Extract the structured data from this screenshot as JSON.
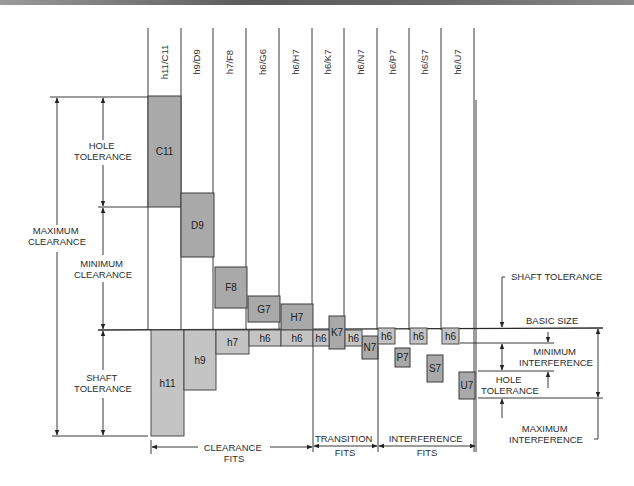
{
  "diagram": {
    "basic_size_y": 330,
    "column_lines_x": [
      148,
      181,
      213,
      246,
      279,
      312,
      344,
      377,
      409,
      441,
      474
    ],
    "columns": [
      {
        "header": "h11/C11"
      },
      {
        "header": "h9/D9"
      },
      {
        "header": "h7/F8"
      },
      {
        "header": "h6/G6"
      },
      {
        "header": "h6/H7"
      },
      {
        "header": "h6/K7"
      },
      {
        "header": "h6/N7"
      },
      {
        "header": "h6/P7"
      },
      {
        "header": "h6/S7"
      },
      {
        "header": "h6/U7"
      }
    ],
    "hole_boxes": [
      {
        "label": "C11",
        "x": 148,
        "y": 96,
        "w": 33,
        "h": 111
      },
      {
        "label": "D9",
        "x": 181,
        "y": 193,
        "w": 33,
        "h": 64
      },
      {
        "label": "F8",
        "x": 215,
        "y": 267,
        "w": 32,
        "h": 41
      },
      {
        "label": "G7",
        "x": 248,
        "y": 296,
        "w": 32,
        "h": 26
      },
      {
        "label": "H7",
        "x": 281,
        "y": 304,
        "w": 32,
        "h": 26
      },
      {
        "label": "K7",
        "x": 329,
        "y": 316,
        "w": 16,
        "h": 33
      },
      {
        "label": "N7",
        "x": 362,
        "y": 336,
        "w": 16,
        "h": 23
      },
      {
        "label": "P7",
        "x": 395,
        "y": 348,
        "w": 15,
        "h": 19
      },
      {
        "label": "S7",
        "x": 427,
        "y": 355,
        "w": 16,
        "h": 27
      },
      {
        "label": "U7",
        "x": 459,
        "y": 372,
        "w": 16,
        "h": 27
      }
    ],
    "shaft_boxes": [
      {
        "label": "h11",
        "x": 151,
        "y": 330,
        "w": 33,
        "h": 106
      },
      {
        "label": "h9",
        "x": 184,
        "y": 330,
        "w": 32,
        "h": 60
      },
      {
        "label": "h7",
        "x": 216,
        "y": 330,
        "w": 33,
        "h": 24
      },
      {
        "label": "h6",
        "x": 249,
        "y": 330,
        "w": 32,
        "h": 16
      },
      {
        "label": "h6",
        "x": 281,
        "y": 330,
        "w": 32,
        "h": 16
      },
      {
        "label": "h6",
        "x": 313,
        "y": 330,
        "w": 16,
        "h": 16
      },
      {
        "label": "h6",
        "x": 345,
        "y": 330,
        "w": 17,
        "h": 16
      },
      {
        "label": "h6",
        "x": 378,
        "y": 328,
        "w": 17,
        "h": 16
      },
      {
        "label": "h6",
        "x": 410,
        "y": 328,
        "w": 17,
        "h": 16
      },
      {
        "label": "h6",
        "x": 442,
        "y": 328,
        "w": 17,
        "h": 16
      }
    ],
    "left_annotations": {
      "hole_tolerance": [
        "HOLE",
        "TOLERANCE"
      ],
      "maximum_clearance": [
        "MAXIMUM",
        "CLEARANCE"
      ],
      "minimum_clearance": [
        "MINIMUM",
        "CLEARANCE"
      ],
      "shaft_tolerance": [
        "SHAFT",
        "TOLERANCE"
      ]
    },
    "right_annotations": {
      "shaft_tolerance": "SHAFT TOLERANCE",
      "basic_size": "BASIC SIZE",
      "minimum_interference": [
        "MINIMUM",
        "INTERFERENCE"
      ],
      "hole_tolerance": [
        "HOLE",
        "TOLERANCE"
      ],
      "maximum_interference": [
        "MAXIMUM",
        "INTERFERENCE"
      ]
    },
    "fit_groups": [
      {
        "label_1": "CLEARANCE",
        "label_2": "FITS",
        "x1": 151,
        "x2": 313
      },
      {
        "label_1": "TRANSITION",
        "label_2": "FITS",
        "x1": 313,
        "x2": 378
      },
      {
        "label_1": "INTERFERENCE",
        "label_2": "FITS",
        "x1": 378,
        "x2": 476
      }
    ],
    "colors": {
      "hole_fill": "#a9a9a9",
      "shaft_fill": "#c4c4c4",
      "line": "#3a3a3a"
    }
  }
}
